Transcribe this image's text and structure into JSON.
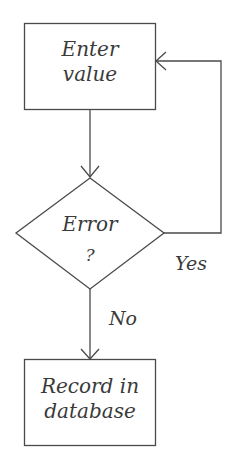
{
  "diagram": {
    "type": "flowchart",
    "nodes": [
      {
        "id": "enter",
        "shape": "rectangle",
        "line1": "Enter",
        "line2": "value"
      },
      {
        "id": "error",
        "shape": "diamond",
        "line1": "Error",
        "line2": "?"
      },
      {
        "id": "record",
        "shape": "rectangle",
        "line1": "Record in",
        "line2": "database"
      }
    ],
    "edges": [
      {
        "from": "enter",
        "to": "error",
        "label": ""
      },
      {
        "from": "error",
        "to": "enter",
        "label": "Yes"
      },
      {
        "from": "error",
        "to": "record",
        "label": "No"
      }
    ],
    "labels": {
      "yes": "Yes",
      "no": "No"
    },
    "colors": {
      "stroke": "#4a4a4a",
      "text": "#3a3a3a",
      "background": "#ffffff"
    }
  }
}
